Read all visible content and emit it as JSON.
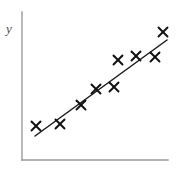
{
  "figure": {
    "width": 180,
    "height": 172,
    "background_color": "#ffffff"
  },
  "axes": {
    "y_axis_label": "y",
    "x_axis_label": "",
    "axis_color": "#9a9a9a",
    "y_axis": {
      "x": 22,
      "y_top": 12,
      "y_bottom": 160
    },
    "x_axis": {
      "y": 160,
      "x_left": 22,
      "x_right": 168
    },
    "ticks": [],
    "tick_labels": [],
    "grid": false
  },
  "chart_data": {
    "type": "scatter",
    "title": "",
    "subtitle": "",
    "xlabel": "",
    "ylabel": "y",
    "grid": false,
    "legend": false,
    "legend_position": "none",
    "marker_symbol": "x",
    "marker_color": "#111111",
    "n_points": 11,
    "points": [
      {
        "x": 36,
        "y": 126
      },
      {
        "x": 60,
        "y": 124
      },
      {
        "x": 81,
        "y": 105
      },
      {
        "x": 96,
        "y": 89
      },
      {
        "x": 114,
        "y": 87
      },
      {
        "x": 118,
        "y": 60
      },
      {
        "x": 136,
        "y": 56
      },
      {
        "x": 155,
        "y": 57
      },
      {
        "x": 163,
        "y": 32
      },
      {
        "x": 97,
        "y": 89
      },
      {
        "x": 115,
        "y": 88
      }
    ],
    "points_plot": [
      {
        "x": 36,
        "y": 126,
        "label": "point-1"
      },
      {
        "x": 60,
        "y": 124,
        "label": "point-2"
      },
      {
        "x": 81,
        "y": 105,
        "label": "point-3"
      },
      {
        "x": 96,
        "y": 89,
        "label": "point-4"
      },
      {
        "x": 114,
        "y": 87,
        "label": "point-5"
      },
      {
        "x": 118,
        "y": 60,
        "label": "point-6"
      },
      {
        "x": 136,
        "y": 56,
        "label": "point-7"
      },
      {
        "x": 155,
        "y": 57,
        "label": "point-8"
      },
      {
        "x": 163,
        "y": 32,
        "label": "point-9"
      }
    ],
    "fit_line": {
      "type": "line-of-best-fit",
      "color": "#1a1a1a",
      "x1": 35,
      "y1": 136,
      "x2": 167,
      "y2": 40,
      "trend": "positive"
    },
    "annotations": []
  }
}
